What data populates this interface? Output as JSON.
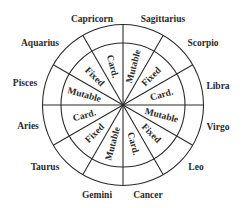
{
  "diagram": {
    "type": "zodiac-modality-wheel",
    "center": [
      123,
      105
    ],
    "outer_radius": 80.5,
    "inner_radius": 62,
    "modality_label_radius": 40,
    "line_color": "#2a2a2a",
    "signs": [
      {
        "name": "Capricorn",
        "x": 92,
        "y": 22
      },
      {
        "name": "Sagittarius",
        "x": 163,
        "y": 22
      },
      {
        "name": "Scorpio",
        "x": 203,
        "y": 46
      },
      {
        "name": "Libra",
        "x": 218,
        "y": 89
      },
      {
        "name": "Virgo",
        "x": 218,
        "y": 130
      },
      {
        "name": "Leo",
        "x": 196,
        "y": 170
      },
      {
        "name": "Cancer",
        "x": 148,
        "y": 198
      },
      {
        "name": "Gemini",
        "x": 97,
        "y": 198
      },
      {
        "name": "Taurus",
        "x": 45,
        "y": 170
      },
      {
        "name": "Aries",
        "x": 28,
        "y": 129
      },
      {
        "name": "Pisces",
        "x": 25,
        "y": 86
      },
      {
        "name": "Aquarius",
        "x": 40,
        "y": 46
      }
    ],
    "sectors": [
      {
        "mid_angle": 105,
        "label": "Card."
      },
      {
        "mid_angle": 135,
        "label": "Fixed"
      },
      {
        "mid_angle": 165,
        "label": "Mutable"
      },
      {
        "mid_angle": 195,
        "label": "Card."
      },
      {
        "mid_angle": 225,
        "label": "Fixed"
      },
      {
        "mid_angle": 255,
        "label": "Mutable"
      },
      {
        "mid_angle": 285,
        "label": "Card."
      },
      {
        "mid_angle": 315,
        "label": "Fixed"
      },
      {
        "mid_angle": 345,
        "label": "Mutable"
      },
      {
        "mid_angle": 15,
        "label": "Card."
      },
      {
        "mid_angle": 45,
        "label": "Fixed"
      },
      {
        "mid_angle": 75,
        "label": "Mutable"
      }
    ],
    "spoke_angles": [
      0,
      30,
      60,
      90,
      120,
      150
    ]
  }
}
